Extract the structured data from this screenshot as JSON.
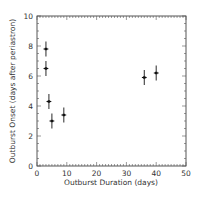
{
  "chart_data": {
    "type": "scatter",
    "title": "",
    "xlabel": "Outburst Duration (days)",
    "ylabel": "Outburst Onset (days after periastron)",
    "xlim": [
      0,
      50
    ],
    "ylim": [
      0,
      10
    ],
    "xticks": [
      0,
      10,
      20,
      30,
      40,
      50
    ],
    "yticks": [
      0,
      2,
      4,
      6,
      8,
      10
    ],
    "grid": false,
    "legend": null,
    "series": [
      {
        "name": "outbursts",
        "marker": "cross-with-errorbars",
        "color": "#111111",
        "points": [
          {
            "x": 3,
            "y": 7.8,
            "xerr": 0.8,
            "yerr": 0.5
          },
          {
            "x": 3,
            "y": 6.5,
            "xerr": 0.8,
            "yerr": 0.5
          },
          {
            "x": 4,
            "y": 4.3,
            "xerr": 0.8,
            "yerr": 0.5
          },
          {
            "x": 5,
            "y": 3.0,
            "xerr": 0.8,
            "yerr": 0.5
          },
          {
            "x": 9,
            "y": 3.4,
            "xerr": 0.8,
            "yerr": 0.5
          },
          {
            "x": 36,
            "y": 5.9,
            "xerr": 0.8,
            "yerr": 0.5
          },
          {
            "x": 40,
            "y": 6.2,
            "xerr": 0.8,
            "yerr": 0.5
          }
        ]
      }
    ]
  },
  "labels": {
    "xlabel": "Outburst Duration (days)",
    "ylabel": "Outburst Onset (days after periastron)",
    "xticks": [
      "0",
      "10",
      "20",
      "30",
      "40",
      "50"
    ],
    "yticks": [
      "0",
      "2",
      "4",
      "6",
      "8",
      "10"
    ]
  }
}
